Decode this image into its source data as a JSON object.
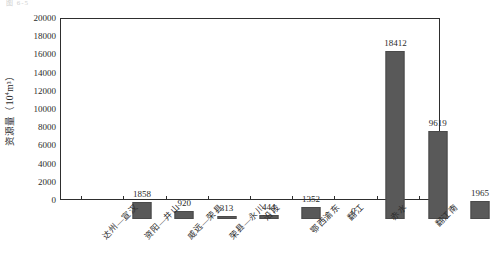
{
  "figure": {
    "top_clipped_text": "图 6-5",
    "y_axis_label_text": "资源量",
    "y_axis_unit_open": "（10",
    "y_axis_unit_exp": "4",
    "y_axis_unit_close": "m³）"
  },
  "chart_data": {
    "type": "bar",
    "title": "",
    "xlabel": "",
    "ylabel": "资源量（10⁴m³）",
    "ylim": [
      0,
      20000
    ],
    "yticks": [
      0,
      2000,
      4000,
      6000,
      8000,
      10000,
      12000,
      14000,
      16000,
      18000,
      20000
    ],
    "ytick_labels": [
      "0",
      "2000",
      "4000",
      "6000",
      "8000",
      "10000",
      "12000",
      "14000",
      "16000",
      "18000",
      "20000"
    ],
    "grid": false,
    "legend": null,
    "bar_color": "#595959",
    "categories": [
      "达州—宣汉",
      "资阳—井山",
      "威远—荣县",
      "荣县—永川",
      "沿段",
      "鄂西渝东",
      "翻江",
      "赤水",
      "翻江南"
    ],
    "values": [
      1858,
      920,
      313,
      444,
      1352,
      0,
      18412,
      9619,
      1965
    ],
    "value_labels": [
      "1858",
      "920",
      "313",
      "444",
      "1352",
      "0",
      "18412",
      "9619",
      "1965"
    ]
  }
}
